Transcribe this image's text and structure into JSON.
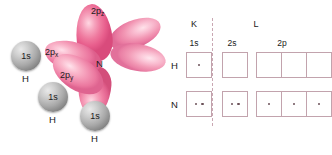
{
  "figure": {
    "colors": {
      "orbital_pink": "#ef7a9f",
      "orbital_pink_light": "#ffd7e2",
      "sphere_grey": "#a9a9a9",
      "box_border": "#c2a3ad",
      "divider": "#c9a7b2",
      "electron_dot": "#6b5158",
      "text": "#1a1a1a"
    }
  },
  "orbital_diagram": {
    "central_atom_label": "N",
    "orbital_labels": [
      {
        "id": "2pz",
        "base": "2p",
        "sub": "z"
      },
      {
        "id": "2px",
        "base": "2p",
        "sub": "x"
      },
      {
        "id": "2py",
        "base": "2p",
        "sub": "y"
      }
    ],
    "hydrogens": [
      {
        "orbital": "1s",
        "element": "H"
      },
      {
        "orbital": "1s",
        "element": "H"
      },
      {
        "orbital": "1s",
        "element": "H"
      }
    ]
  },
  "shell_table": {
    "shells": [
      {
        "name": "K",
        "subshells": [
          "1s"
        ]
      },
      {
        "name": "L",
        "subshells": [
          "2s",
          "2p"
        ]
      }
    ],
    "shell_headers": [
      "K",
      "L"
    ],
    "subshell_headers": [
      "1s",
      "2s",
      "2p"
    ],
    "rows": [
      {
        "element": "H",
        "boxes": [
          {
            "subshell": "1s",
            "electrons": 1
          },
          {
            "subshell": "2s",
            "electrons": 0
          },
          {
            "subshell": "2p",
            "electrons": 0
          },
          {
            "subshell": "2p",
            "electrons": 0
          },
          {
            "subshell": "2p",
            "electrons": 0
          }
        ]
      },
      {
        "element": "N",
        "boxes": [
          {
            "subshell": "1s",
            "electrons": 2
          },
          {
            "subshell": "2s",
            "electrons": 2
          },
          {
            "subshell": "2p",
            "electrons": 1
          },
          {
            "subshell": "2p",
            "electrons": 1
          },
          {
            "subshell": "2p",
            "electrons": 1
          }
        ]
      }
    ]
  }
}
